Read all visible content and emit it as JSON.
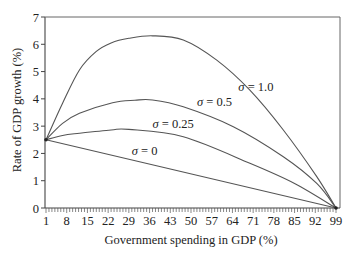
{
  "chart_data": {
    "type": "line",
    "title": "",
    "xlabel": "Government spending in GDP (%)",
    "ylabel": "Rate of GDP growth (%)",
    "xlim": [
      1,
      99
    ],
    "ylim": [
      0,
      7
    ],
    "x_ticks": [
      1,
      8,
      15,
      22,
      29,
      36,
      43,
      50,
      57,
      64,
      71,
      78,
      85,
      92,
      99
    ],
    "y_ticks": [
      0,
      1,
      2,
      3,
      4,
      5,
      6,
      7
    ],
    "minor_x_ticks_every": 1,
    "grid": false,
    "legend": "inline curve labels",
    "series": [
      {
        "name": "σ = 1.0",
        "label_pos": [
          66,
          4.3
        ],
        "x": [
          1,
          6.6,
          12.3,
          17.9,
          23,
          29,
          37,
          47.4,
          58.7,
          69.9,
          81.2,
          92.5,
          99
        ],
        "values": [
          2.5,
          3.84,
          5.06,
          5.73,
          6.05,
          6.22,
          6.31,
          6.16,
          5.42,
          4.32,
          2.86,
          1.15,
          0
        ]
      },
      {
        "name": "σ = 0.5",
        "label_pos": [
          52,
          3.72
        ],
        "x": [
          1,
          6.6,
          12.3,
          23.5,
          31,
          37,
          47.4,
          64.3,
          81.2,
          92.5,
          99
        ],
        "values": [
          2.5,
          3.1,
          3.47,
          3.86,
          3.95,
          3.96,
          3.71,
          2.98,
          1.88,
          0.9,
          0
        ]
      },
      {
        "name": "σ = 0.25",
        "label_pos": [
          37,
          2.95
        ],
        "x": [
          1,
          6.6,
          12.3,
          23,
          29,
          47.4,
          69.9,
          85,
          99
        ],
        "values": [
          2.5,
          2.66,
          2.74,
          2.86,
          2.88,
          2.61,
          1.64,
          0.9,
          0
        ]
      },
      {
        "name": "σ = 0",
        "label_pos": [
          30,
          1.95
        ],
        "x": [
          1,
          99
        ],
        "values": [
          2.5,
          0
        ]
      }
    ]
  }
}
